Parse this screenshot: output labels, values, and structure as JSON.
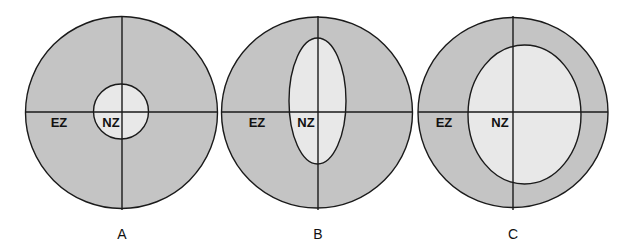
{
  "colors": {
    "outer_zone": "#c4c4c4",
    "inner_zone": "#e8e8e8",
    "stroke": "#1a1a1a"
  },
  "panels": [
    {
      "caption": "A",
      "outer_label": "EZ",
      "inner_label": "NZ",
      "inner_shape": "small circle"
    },
    {
      "caption": "B",
      "outer_label": "EZ",
      "inner_label": "NZ",
      "inner_shape": "tall narrow ellipse"
    },
    {
      "caption": "C",
      "outer_label": "EZ",
      "inner_label": "NZ",
      "inner_shape": "large ellipse offset right"
    }
  ]
}
